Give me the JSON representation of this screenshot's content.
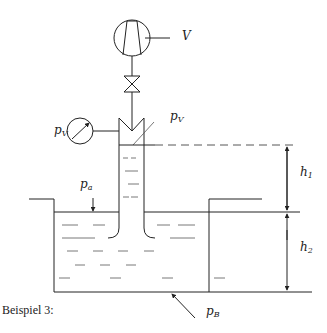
{
  "diagram": {
    "caption": "Beispiel 3:",
    "labels": {
      "pump": {
        "symbol": "V"
      },
      "gauge_pressure": {
        "base": "p",
        "sub": "V"
      },
      "vessel_pressure": {
        "base": "p",
        "sub": "V"
      },
      "atmospheric_pressure": {
        "base": "p",
        "sub": "a"
      },
      "bottom_pressure": {
        "base": "p",
        "sub": "B"
      },
      "height_1": {
        "base": "h",
        "sub": "1"
      },
      "height_2": {
        "base": "h",
        "sub": "2"
      }
    },
    "components": [
      "vacuum-pump",
      "valve",
      "pressure-gauge",
      "inverted-tube",
      "open-tank",
      "dimension-h1",
      "dimension-h2"
    ]
  }
}
